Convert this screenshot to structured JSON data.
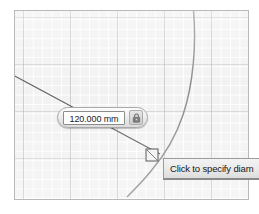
{
  "app": {
    "context": "cad-sketch-canvas"
  },
  "canvas": {
    "background_color": "#f2f2f2",
    "border_color": "#b9b9b9",
    "grid": {
      "minor_color": "#ffffff",
      "major_color": "#969696",
      "minor_spacing_px": 9.4,
      "major_spacing_px": 47,
      "visible": true
    },
    "geometry": {
      "line_color": "#555555",
      "arc_color": "#888888",
      "point_marker_color": "#333333",
      "entities": [
        {
          "name": "sketch-line",
          "type": "line",
          "from": [
            0,
            74
          ],
          "to": [
            146,
            152
          ]
        },
        {
          "name": "sketch-arc",
          "type": "arc",
          "description": "large-radius arc sweeping from top to bottom-right"
        },
        {
          "name": "sketch-point-handle",
          "type": "point",
          "at": [
            153,
            152
          ]
        }
      ]
    }
  },
  "dimension_editor": {
    "name": "dimension-value-editor",
    "value": "120.000 mm",
    "placeholder": "0.000 mm",
    "units": "mm",
    "numeric_value": 120.0,
    "lock": {
      "icon": "lock-icon",
      "label": "Lock dimension",
      "state": "locked"
    }
  },
  "tooltip": {
    "name": "status-tooltip",
    "text": "Click to specify diam",
    "clipped": true
  }
}
